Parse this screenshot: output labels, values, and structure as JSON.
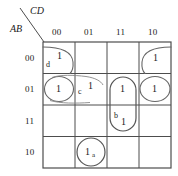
{
  "diagram": {
    "type": "karnaugh-map",
    "variables_top": "CD",
    "variables_left": "AB",
    "column_headers": [
      "00",
      "01",
      "11",
      "10"
    ],
    "row_headers": [
      "00",
      "01",
      "11",
      "10"
    ],
    "cells": [
      {
        "row": "00",
        "col": "00",
        "value": "1"
      },
      {
        "row": "00",
        "col": "01",
        "value": ""
      },
      {
        "row": "00",
        "col": "11",
        "value": ""
      },
      {
        "row": "00",
        "col": "10",
        "value": "1"
      },
      {
        "row": "01",
        "col": "00",
        "value": "1"
      },
      {
        "row": "01",
        "col": "01",
        "value": "1"
      },
      {
        "row": "01",
        "col": "11",
        "value": "1"
      },
      {
        "row": "01",
        "col": "10",
        "value": "1"
      },
      {
        "row": "11",
        "col": "00",
        "value": ""
      },
      {
        "row": "11",
        "col": "01",
        "value": ""
      },
      {
        "row": "11",
        "col": "11",
        "value": "1"
      },
      {
        "row": "11",
        "col": "10",
        "value": ""
      },
      {
        "row": "10",
        "col": "00",
        "value": ""
      },
      {
        "row": "10",
        "col": "01",
        "value": "1"
      },
      {
        "row": "10",
        "col": "11",
        "value": ""
      },
      {
        "row": "10",
        "col": "10",
        "value": ""
      }
    ],
    "group_labels": {
      "a": "a",
      "b": "b",
      "c": "c",
      "d": "d"
    },
    "ones": {
      "r00c00": "1",
      "r00c10": "1",
      "r01c00": "1",
      "r01c01": "1",
      "r01c11": "1",
      "r01c10": "1",
      "r11c11": "1",
      "r10c01": "1"
    },
    "colors": {
      "grid_line": "#4d4d4d",
      "group_outline": "#555555",
      "text": "#1a1a1a",
      "background": "#ffffff"
    }
  }
}
